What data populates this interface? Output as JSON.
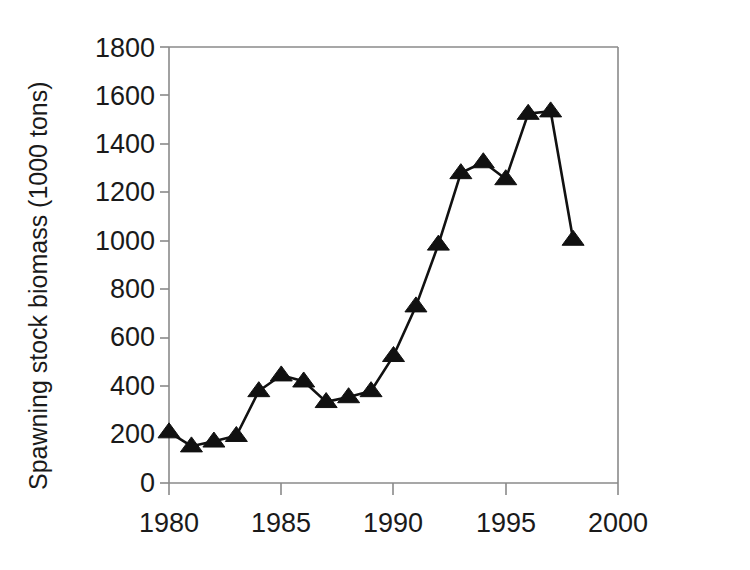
{
  "chart_data": {
    "type": "line",
    "title": "",
    "xlabel": "",
    "ylabel": "Spawning stock biomass (1000 tons)",
    "x": [
      1980,
      1981,
      1982,
      1983,
      1984,
      1985,
      1986,
      1987,
      1988,
      1989,
      1990,
      1991,
      1992,
      1993,
      1994,
      1995,
      1996,
      1997,
      1998
    ],
    "values": [
      210,
      152,
      172,
      195,
      380,
      445,
      420,
      335,
      355,
      380,
      525,
      730,
      985,
      1280,
      1325,
      1255,
      1525,
      1535,
      1005
    ],
    "series": [
      {
        "name": "Spawning stock biomass",
        "values": [
          210,
          152,
          172,
          195,
          380,
          445,
          420,
          335,
          355,
          380,
          525,
          730,
          985,
          1280,
          1325,
          1255,
          1525,
          1535,
          1005
        ]
      }
    ],
    "xlim": [
      1980,
      2000
    ],
    "ylim": [
      0,
      1800
    ],
    "xticks": [
      1980,
      1985,
      1990,
      1995,
      2000
    ],
    "xtick_labels": [
      "1980",
      "1985",
      "1990",
      "1995",
      "2000"
    ],
    "yticks": [
      0,
      200,
      400,
      600,
      800,
      1000,
      1200,
      1400,
      1600,
      1800
    ],
    "ytick_labels": [
      "0",
      "200",
      "400",
      "600",
      "800",
      "1000",
      "1200",
      "1400",
      "1600",
      "1800"
    ],
    "grid": false,
    "legend": false,
    "marker": "triangle",
    "line_color": "#111111",
    "marker_color": "#111111",
    "axis_color": "#8a8a8a"
  },
  "axes": {
    "y_axis_title": "Spawning stock biomass (1000 tons)"
  }
}
